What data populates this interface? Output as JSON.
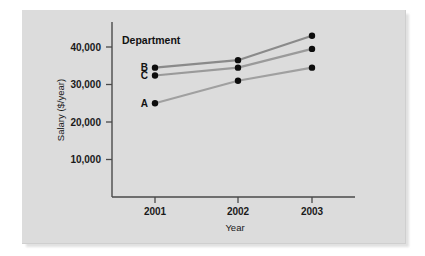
{
  "figure": {
    "panel_bg": "#dcdcdc",
    "page_bg": "#ffffff"
  },
  "legend": {
    "title": "Department",
    "position": "inside-top-left"
  },
  "chart_data": {
    "type": "line",
    "title": "",
    "subtitle": "",
    "xlabel": "Year",
    "ylabel": "Salary ($/year)",
    "categories": [
      "2001",
      "2002",
      "2003"
    ],
    "x": [
      2001,
      2002,
      2003
    ],
    "xlim": [
      2000.6,
      2003.4
    ],
    "ylim": [
      0,
      45000
    ],
    "yticks": [
      10000,
      20000,
      30000,
      40000
    ],
    "ytick_labels": [
      "10,000",
      "20,000",
      "30,000",
      "40,000"
    ],
    "xtick_labels": [
      "2001",
      "2002",
      "2003"
    ],
    "grid": false,
    "legend_position": "series-labels-at-left",
    "line_color": "#8a8a8a",
    "marker_color": "#0d0d0d",
    "series": [
      {
        "name": "B",
        "label": "B",
        "values": [
          34500,
          36500,
          43000
        ],
        "color": "#8a8a8a"
      },
      {
        "name": "C",
        "label": "C",
        "values": [
          32400,
          34500,
          39500
        ],
        "color": "#9a9a9a"
      },
      {
        "name": "A",
        "label": "A",
        "values": [
          25000,
          31000,
          34500
        ],
        "color": "#a0a0a0"
      }
    ],
    "annotations": [
      "Department"
    ]
  }
}
